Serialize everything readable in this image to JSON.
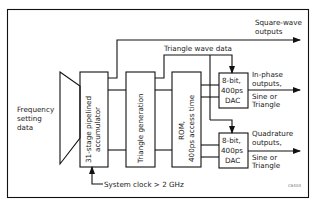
{
  "diagram": {
    "type": "block-diagram",
    "input": {
      "label_lines": [
        "Frequency",
        "setting",
        "data"
      ]
    },
    "blocks": [
      {
        "id": "accumulator",
        "label_lines": [
          "31-stage pipelined",
          "accumulator"
        ]
      },
      {
        "id": "triangle",
        "label_lines": [
          "Triangle generation"
        ]
      },
      {
        "id": "rom",
        "label_lines": [
          "ROM,",
          "400ps access time"
        ]
      },
      {
        "id": "dac1",
        "label_lines": [
          "8-bit,",
          "400ps",
          "DAC"
        ]
      },
      {
        "id": "dac2",
        "label_lines": [
          "8-bit,",
          "400ps",
          "DAC"
        ]
      }
    ],
    "signals": {
      "triangle_wave_data": "Triangle wave data",
      "system_clock": "System clock > 2 GHz"
    },
    "outputs": {
      "square": [
        "Square-wave",
        "outputs"
      ],
      "inphase": [
        "In-phase",
        "outputs,",
        "Sine or",
        "Triangle"
      ],
      "quadrature": [
        "Quadrature",
        "outputs,",
        "Sine or",
        "Triangle"
      ]
    },
    "figure_code": "C6404"
  }
}
